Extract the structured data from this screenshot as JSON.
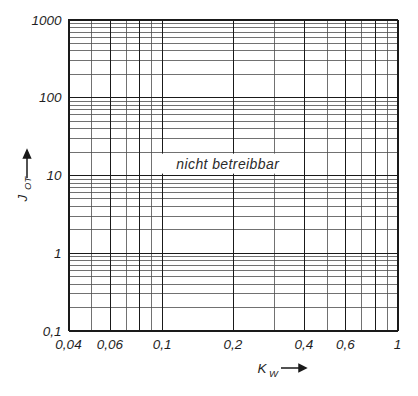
{
  "top_fragment": {
    "text": ""
  },
  "chart_data": {
    "type": "line",
    "title": "",
    "subtitle": "",
    "xlabel": "K",
    "xlabel_sub": "W",
    "ylabel": "J",
    "ylabel_sub": "OT",
    "xscale": "log",
    "yscale": "log",
    "xlim": [
      0.04,
      1
    ],
    "ylim": [
      0.1,
      1000
    ],
    "grid": true,
    "legend": null,
    "series": [],
    "x_tick_values": [
      0.04,
      0.06,
      0.1,
      0.2,
      0.4,
      0.6,
      1
    ],
    "x_tick_labels": [
      "0,04",
      "0,06",
      "0,1",
      "0,2",
      "0,4",
      "0,6",
      "1"
    ],
    "y_tick_values": [
      0.1,
      1,
      10,
      100,
      1000
    ],
    "y_tick_labels": [
      "0,1",
      "1",
      "10",
      "100",
      "1000"
    ],
    "x_gridlines": [
      0.04,
      0.05,
      0.06,
      0.07,
      0.08,
      0.09,
      0.1,
      0.2,
      0.3,
      0.4,
      0.5,
      0.6,
      0.7,
      0.8,
      0.9,
      1
    ],
    "x_major_gridlines": [
      0.04,
      0.06,
      0.08,
      0.1,
      0.2,
      0.4,
      0.6,
      0.8,
      1
    ],
    "y_gridlines": [
      0.1,
      0.2,
      0.3,
      0.4,
      0.5,
      0.6,
      0.7,
      0.8,
      0.9,
      1,
      2,
      3,
      4,
      5,
      6,
      7,
      8,
      9,
      10,
      20,
      30,
      40,
      50,
      60,
      70,
      80,
      90,
      100,
      200,
      300,
      400,
      500,
      600,
      700,
      800,
      900,
      1000
    ],
    "y_major_gridlines": [
      0.1,
      1,
      10,
      100,
      1000
    ],
    "annotations": [
      {
        "text": "nicht betreibbar",
        "x": 0.19,
        "y": 14,
        "region": "full-plot"
      }
    ],
    "colors": {
      "grid": "#4d4d4d",
      "axis": "#1a1a1a",
      "background": "#ffffff",
      "text": "#1f1f1f"
    }
  }
}
